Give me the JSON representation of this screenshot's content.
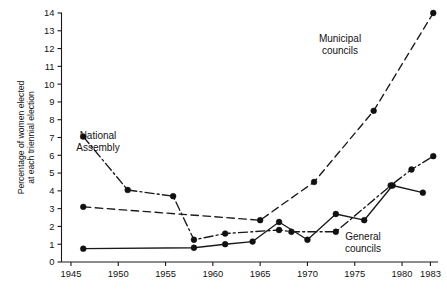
{
  "chart_data": {
    "type": "line",
    "title": "",
    "subtitle": "",
    "xlabel": "",
    "ylabel": "Percentage of women elected at each triennial election",
    "xlim": [
      1944.0,
      1983.8
    ],
    "ylim": [
      0,
      14
    ],
    "grid": false,
    "legend_position": "inline-annotations",
    "x_ticks": [
      1945,
      1950,
      1955,
      1960,
      1965,
      1970,
      1975,
      1980,
      1983
    ],
    "x_tick_labels": [
      "1945",
      "1950",
      "1955",
      "1960",
      "1965",
      "1970",
      "1975",
      "1980",
      "1983"
    ],
    "y_ticks": [
      0,
      1,
      2,
      3,
      4,
      5,
      6,
      7,
      8,
      9,
      10,
      11,
      12,
      13,
      14
    ],
    "y_tick_labels": [
      "0",
      "1",
      "2",
      "3",
      "4",
      "5",
      "6",
      "7",
      "8",
      "9",
      "10",
      "11",
      "12",
      "13",
      "14"
    ],
    "series": [
      {
        "name": "National Assembly",
        "style": "dash-dot",
        "dasharray": "9,3.2,2,3.2",
        "marker": "filled-circle",
        "x": [
          1946.3,
          1951.0,
          1955.8,
          1958.0,
          1961.3,
          1967.0,
          1968.3,
          1973.0,
          1978.8,
          1981.0,
          1983.3
        ],
        "y": [
          7.05,
          4.05,
          3.7,
          1.25,
          1.6,
          1.8,
          1.7,
          1.7,
          4.3,
          5.2,
          5.95
        ]
      },
      {
        "name": "Municipal councils",
        "style": "dashed",
        "dasharray": "7.5,4.5",
        "marker": "filled-circle",
        "x": [
          1946.3,
          1965.0,
          1970.7,
          1977.0,
          1983.3
        ],
        "y": [
          3.1,
          2.35,
          4.5,
          8.5,
          14.0
        ]
      },
      {
        "name": "General councils",
        "style": "solid",
        "dasharray": "none",
        "marker": "filled-circle",
        "x": [
          1946.3,
          1958.0,
          1961.3,
          1964.2,
          1967.0,
          1970.0,
          1973.0,
          1976.0,
          1979.0,
          1982.2
        ],
        "y": [
          0.75,
          0.8,
          1.0,
          1.15,
          2.25,
          1.25,
          2.7,
          2.35,
          4.3,
          3.9
        ]
      }
    ],
    "annotations": [
      {
        "id": "national-assembly",
        "line1": "National",
        "line2": "Assembly",
        "x_px": 98,
        "y_px": 139
      },
      {
        "id": "municipal-councils",
        "line1": "Municipal",
        "line2": "councils",
        "x_px": 340,
        "y_px": 42
      },
      {
        "id": "general-councils",
        "line1": "General",
        "line2": "councils",
        "x_px": 363,
        "y_px": 240
      }
    ]
  },
  "axes": {
    "y_axis_title_line1": "Percentage of women elected",
    "y_axis_title_line2": "at each triennial election"
  }
}
